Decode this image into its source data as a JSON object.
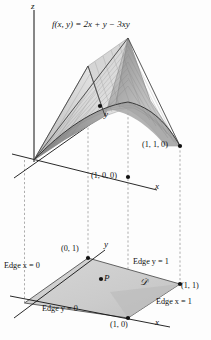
{
  "figure": {
    "title_formula": "f(x, y) = 2x + y − 3xy",
    "axes": {
      "z_top": "z",
      "x_upper": "x",
      "y_upper": "y",
      "x_lower": "x",
      "y_lower": "y"
    },
    "surface_points": [
      {
        "id": "corner-1-1-0",
        "label": "(1, 1, 0)"
      },
      {
        "id": "axis-point-1-0-0",
        "label": "(1, 0, 0)"
      }
    ],
    "domain": {
      "region_label": "𝒟",
      "interior_point_label": "P",
      "vertices": [
        {
          "id": "vertex-0-1",
          "label": "(0, 1)"
        },
        {
          "id": "vertex-1-1",
          "label": "(1, 1)"
        },
        {
          "id": "vertex-1-0",
          "label": "(1, 0)"
        }
      ],
      "edges": [
        {
          "id": "edge-x-0",
          "label": "Edge x = 0"
        },
        {
          "id": "edge-y-1",
          "label": "Edge y = 1"
        },
        {
          "id": "edge-x-1",
          "label": "Edge x = 1"
        },
        {
          "id": "edge-y-0",
          "label": "Edge y = 0"
        }
      ]
    },
    "colors": {
      "ink": "#111111",
      "surface_light": "#d8d8d8",
      "surface_mid": "#b4b4b4",
      "surface_dark": "#8e8e8e",
      "domain_fill": "#cfcfcf",
      "domain_fill_dark": "#bdbdbd",
      "dashed": "#8a8a8a",
      "background": "#fdfdfd"
    }
  }
}
